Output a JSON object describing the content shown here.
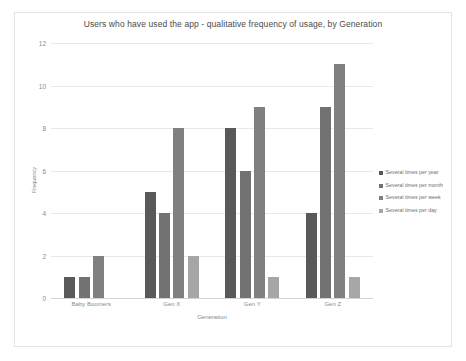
{
  "chart_data": {
    "type": "bar",
    "title": "Users who have used the app - qualitative frequency of usage, by Generation",
    "xlabel": "Generation",
    "ylabel": "Frequency",
    "categories": [
      "Baby Boomers",
      "Gen X",
      "Gen Y",
      "Gen Z"
    ],
    "series": [
      {
        "name": "Several times per year",
        "color": "#595959",
        "values": [
          1,
          5,
          8,
          4
        ]
      },
      {
        "name": "Several times per month",
        "color": "#727272",
        "values": [
          1,
          4,
          6,
          9
        ]
      },
      {
        "name": "Several times per week",
        "color": "#808080",
        "values": [
          2,
          8,
          9,
          11
        ]
      },
      {
        "name": "Several times per day",
        "color": "#a6a6a6",
        "values": [
          0,
          2,
          1,
          1
        ]
      }
    ],
    "ylim": [
      0,
      12
    ],
    "yticks": [
      "0",
      "2",
      "4",
      "6",
      "8",
      "10",
      "12"
    ],
    "grid": true,
    "legend_position": "right",
    "orientation": "vertical",
    "grouping": "clustered"
  },
  "style": {
    "frame_border_color": "#e3e3e3",
    "gridline_color": "#e9e9e9",
    "axis_text_color": "#8a8a8a",
    "title_color": "#4a4a4a",
    "legend_text_color": "#6d6d6d",
    "background": "#ffffff"
  }
}
